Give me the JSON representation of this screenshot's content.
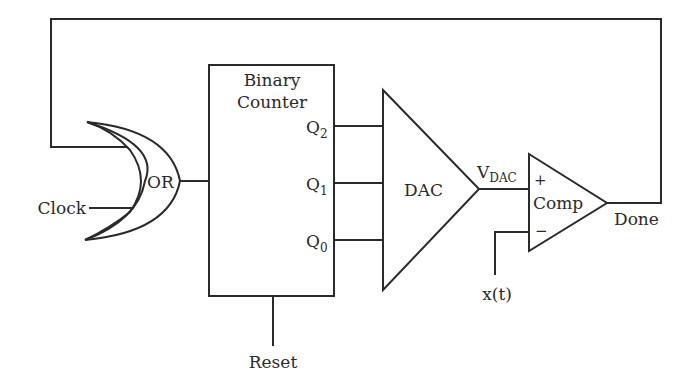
{
  "diagram": {
    "type": "block-diagram",
    "colors": {
      "stroke": "#2a2a2a",
      "background": "#ffffff"
    },
    "blocks": {
      "or_gate": {
        "label": "OR"
      },
      "counter": {
        "title_line1": "Binary",
        "title_line2": "Counter"
      },
      "outputs": [
        {
          "main": "Q",
          "sub": "2"
        },
        {
          "main": "Q",
          "sub": "1"
        },
        {
          "main": "Q",
          "sub": "0"
        }
      ],
      "dac": {
        "label": "DAC"
      },
      "comparator": {
        "label": "Comp",
        "plus": "+",
        "minus": "−"
      }
    },
    "signals": {
      "clock": "Clock",
      "reset": "Reset",
      "vdac_main": "V",
      "vdac_sub": "DAC",
      "input": "x(t)",
      "done": "Done"
    },
    "connections": [
      "Clock -> OR",
      "Done -> OR (feedback)",
      "OR -> Binary Counter clock",
      "Q2, Q1, Q0 -> DAC",
      "DAC -> Comp + (V_DAC)",
      "x(t) -> Comp -",
      "Comp -> Done",
      "Reset -> Binary Counter"
    ]
  }
}
